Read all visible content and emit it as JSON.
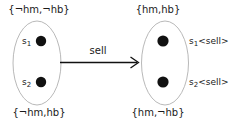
{
  "diagram": {
    "type": "state-transition",
    "background_color": "#ffffff",
    "ellipse_stroke_color": "#b9b9b9",
    "dot_color": "#111111",
    "arrow_color": "#111111",
    "text_color": "#1a1a1a",
    "source_cluster": {
      "top_label": "{¬hm,¬hb}",
      "bottom_label": "{¬hm,hb}",
      "states": [
        {
          "name": "s",
          "subscript": "1",
          "suffix": ""
        },
        {
          "name": "s",
          "subscript": "2",
          "suffix": ""
        }
      ]
    },
    "target_cluster": {
      "top_label": "{hm,hb}",
      "bottom_label": "{hm,¬hb}",
      "states": [
        {
          "name": "s",
          "subscript": "1",
          "suffix": "<sell>"
        },
        {
          "name": "s",
          "subscript": "2",
          "suffix": "<sell>"
        }
      ]
    },
    "transition": {
      "label": "sell"
    }
  }
}
